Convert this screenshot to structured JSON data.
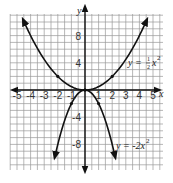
{
  "chart_data": {
    "type": "line",
    "title": "",
    "xlabel": "x",
    "ylabel": "y",
    "xlim": [
      -5.5,
      5.5
    ],
    "ylim": [
      -11.5,
      12.5
    ],
    "grid": true,
    "grid_step": {
      "x": 0.5,
      "y": 1
    },
    "x_ticks": [
      -5,
      -4,
      -3,
      -2,
      -1,
      1,
      2,
      3,
      4,
      5
    ],
    "x_tick_labels": [
      "-5",
      "-4",
      "-3",
      "-2",
      "-1",
      "1",
      "2",
      "3",
      "4",
      "5"
    ],
    "y_ticks": [
      8,
      4,
      -4,
      -8
    ],
    "y_tick_labels": [
      "8",
      "4",
      "-4",
      "-8"
    ],
    "series": [
      {
        "name": "y = 1/2 x^2",
        "label": "y = ½x²",
        "equation": "y = 0.5*x^2",
        "x": [
          -4.5,
          -4,
          -3,
          -2,
          -1,
          0,
          1,
          2,
          3,
          4,
          4.5
        ],
        "values": [
          10.125,
          8,
          4.5,
          2,
          0.5,
          0,
          0.5,
          2,
          4.5,
          8,
          10.125
        ],
        "marked_points": [
          [
            -2,
            2
          ],
          [
            0,
            0
          ],
          [
            2,
            2
          ]
        ],
        "color": "#111111",
        "arrows": true
      },
      {
        "name": "y = -2x^2",
        "label": "y = -2x²",
        "equation": "y = -2*x^2",
        "x": [
          -2.2,
          -2,
          -1.5,
          -1,
          -0.5,
          0,
          0.5,
          1,
          1.5,
          2,
          2.2
        ],
        "values": [
          -9.68,
          -8,
          -4.5,
          -2,
          -0.5,
          0,
          -0.5,
          -2,
          -4.5,
          -8,
          -9.68
        ],
        "marked_points": [
          [
            -1,
            -2
          ],
          [
            0,
            0
          ],
          [
            1,
            -2
          ]
        ],
        "color": "#111111",
        "arrows": true
      }
    ],
    "annotations": [
      {
        "text": "y = ½x²",
        "near": [
          3.3,
          4
        ]
      },
      {
        "text": "y = -2x²",
        "near": [
          2.3,
          -8
        ]
      }
    ]
  },
  "labels": {
    "x_axis": "x",
    "y_axis": "y",
    "eq1_prefix": "y =",
    "eq1_num": "1",
    "eq1_den": "2",
    "eq1_var": "x",
    "eq1_exp": "2",
    "eq2_text": "y = -2x",
    "eq2_exp": "2",
    "xticks": [
      "-5",
      "-4",
      "-3",
      "-2",
      "-1",
      "1",
      "2",
      "3",
      "4",
      "5"
    ],
    "yticks": [
      "8",
      "4",
      "-4",
      "-8"
    ]
  }
}
